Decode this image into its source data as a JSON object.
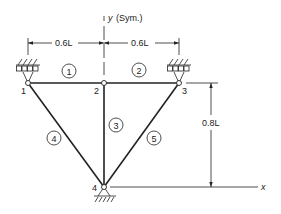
{
  "axes": {
    "y_label": "y",
    "y_note": "(Sym.)",
    "x_label": "x"
  },
  "dimensions": {
    "left_span": "0.6L",
    "right_span": "0.6L",
    "height": "0.8L"
  },
  "nodes": [
    {
      "id": "1",
      "label": "1",
      "support": "roller"
    },
    {
      "id": "2",
      "label": "2",
      "support": "none"
    },
    {
      "id": "3",
      "label": "3",
      "support": "roller"
    },
    {
      "id": "4",
      "label": "4",
      "support": "pin"
    }
  ],
  "elements": [
    {
      "id": "1",
      "label": "1",
      "from": "1",
      "to": "2"
    },
    {
      "id": "2",
      "label": "2",
      "from": "2",
      "to": "3"
    },
    {
      "id": "3",
      "label": "3",
      "from": "2",
      "to": "4"
    },
    {
      "id": "4",
      "label": "4",
      "from": "1",
      "to": "4"
    },
    {
      "id": "5",
      "label": "5",
      "from": "3",
      "to": "4"
    }
  ],
  "colors": {
    "ink": "#222222",
    "background": "#ffffff"
  }
}
